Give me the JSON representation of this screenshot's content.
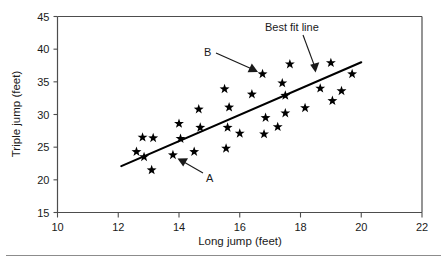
{
  "chart_data": {
    "type": "scatter",
    "title": "",
    "xlabel": "Long jump (feet)",
    "ylabel": "Triple jump (feet)",
    "xlim": [
      10,
      22
    ],
    "ylim": [
      15,
      45
    ],
    "xticks": [
      10,
      12,
      14,
      16,
      18,
      20,
      22
    ],
    "yticks": [
      15,
      20,
      25,
      30,
      35,
      40,
      45
    ],
    "grid": false,
    "legend": "none",
    "marker": "star",
    "marker_color": "#000000",
    "points": [
      {
        "x": 12.6,
        "y": 24.3
      },
      {
        "x": 12.8,
        "y": 26.5
      },
      {
        "x": 12.85,
        "y": 23.5
      },
      {
        "x": 13.15,
        "y": 26.4
      },
      {
        "x": 13.1,
        "y": 21.5
      },
      {
        "x": 13.8,
        "y": 23.8,
        "label": "A"
      },
      {
        "x": 14.0,
        "y": 28.6
      },
      {
        "x": 14.05,
        "y": 26.3
      },
      {
        "x": 14.5,
        "y": 24.3
      },
      {
        "x": 14.65,
        "y": 30.8
      },
      {
        "x": 14.7,
        "y": 28.0
      },
      {
        "x": 15.5,
        "y": 33.9
      },
      {
        "x": 15.55,
        "y": 24.8
      },
      {
        "x": 15.6,
        "y": 28.0
      },
      {
        "x": 15.65,
        "y": 31.1
      },
      {
        "x": 16.0,
        "y": 27.1
      },
      {
        "x": 16.4,
        "y": 33.1
      },
      {
        "x": 16.75,
        "y": 36.2,
        "label": "B"
      },
      {
        "x": 16.8,
        "y": 27.0
      },
      {
        "x": 16.85,
        "y": 29.5
      },
      {
        "x": 17.25,
        "y": 28.1
      },
      {
        "x": 17.4,
        "y": 34.8
      },
      {
        "x": 17.5,
        "y": 30.2
      },
      {
        "x": 17.5,
        "y": 32.9
      },
      {
        "x": 17.65,
        "y": 37.7
      },
      {
        "x": 18.15,
        "y": 31.0
      },
      {
        "x": 18.65,
        "y": 34.0
      },
      {
        "x": 19.0,
        "y": 37.9
      },
      {
        "x": 19.05,
        "y": 32.1
      },
      {
        "x": 19.35,
        "y": 33.6
      },
      {
        "x": 19.7,
        "y": 36.2
      }
    ],
    "best_fit_line": {
      "label": "Best fit line",
      "x_start": 12.1,
      "y_start": 22.1,
      "x_end": 20.0,
      "y_end": 38.0
    },
    "annotations": [
      {
        "name": "A",
        "text": "A",
        "points_to_x": 13.8,
        "points_to_y": 23.8
      },
      {
        "name": "B",
        "text": "B",
        "points_to_x": 16.75,
        "points_to_y": 36.2
      },
      {
        "name": "best-fit-line",
        "text": "Best fit line",
        "points_to_x": 18.55,
        "points_to_y": 35.2
      }
    ]
  },
  "axes": {
    "x_title": "Long jump (feet)",
    "y_title": "Triple jump (feet)",
    "x_tick_labels": [
      "10",
      "12",
      "14",
      "16",
      "18",
      "20",
      "22"
    ],
    "y_tick_labels": [
      "15",
      "20",
      "25",
      "30",
      "35",
      "40",
      "45"
    ]
  },
  "labels": {
    "a": "A",
    "b": "B",
    "best_fit": "Best fit line"
  }
}
